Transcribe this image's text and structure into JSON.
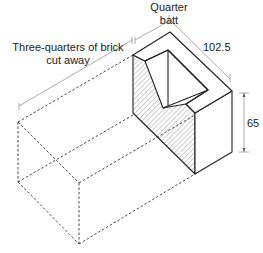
{
  "diagram": {
    "labels": {
      "quarter_batt_line1": "Quarter",
      "quarter_batt_line2": "batt",
      "cut_away_line1": "Three-quarters of brick",
      "cut_away_line2": "cut away",
      "width_dim": "102.5",
      "height_dim": "65"
    },
    "colors": {
      "line": "#222222",
      "dim_line": "#777777",
      "hatch": "#888888",
      "background": "#ffffff"
    }
  }
}
